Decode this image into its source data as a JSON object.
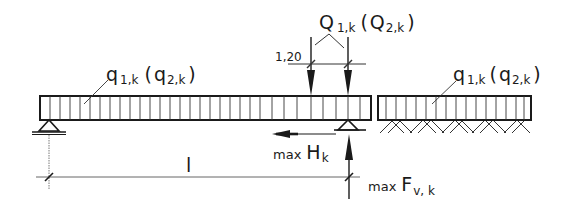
{
  "diagram": {
    "type": "structural-load-diagram",
    "colors": {
      "ink": "#1a1a1a",
      "light": "#666666",
      "background": "#ffffff"
    },
    "labels": {
      "distributed_load_left": {
        "main": "q",
        "sub1": "1,k",
        "paren_open": "(",
        "main2": "q",
        "sub2": "2,k",
        "paren_close": ")"
      },
      "distributed_load_right": {
        "main": "q",
        "sub1": "1,k",
        "paren_open": "(",
        "main2": "q",
        "sub2": "2,k",
        "paren_close": ")"
      },
      "point_loads": {
        "main": "Q",
        "sub1": "1,k",
        "paren_open": "(",
        "main2": "Q",
        "sub2": "2,k",
        "paren_close": ")"
      },
      "spacing_dimension": "1,20",
      "span_length": "l",
      "horizontal_force": {
        "prefix": "max",
        "main": "H",
        "sub": "k"
      },
      "vertical_force": {
        "prefix": "max",
        "main": "F",
        "sub": "v, k"
      }
    },
    "elements": [
      "beam-span (simply supported, pin + roller)",
      "adjacent slab on ground (hatched soil)",
      "uniform distributed load on both",
      "two point loads spaced 1,20",
      "horizontal reaction arrow",
      "vertical reaction arrow",
      "span dimension line l"
    ]
  }
}
